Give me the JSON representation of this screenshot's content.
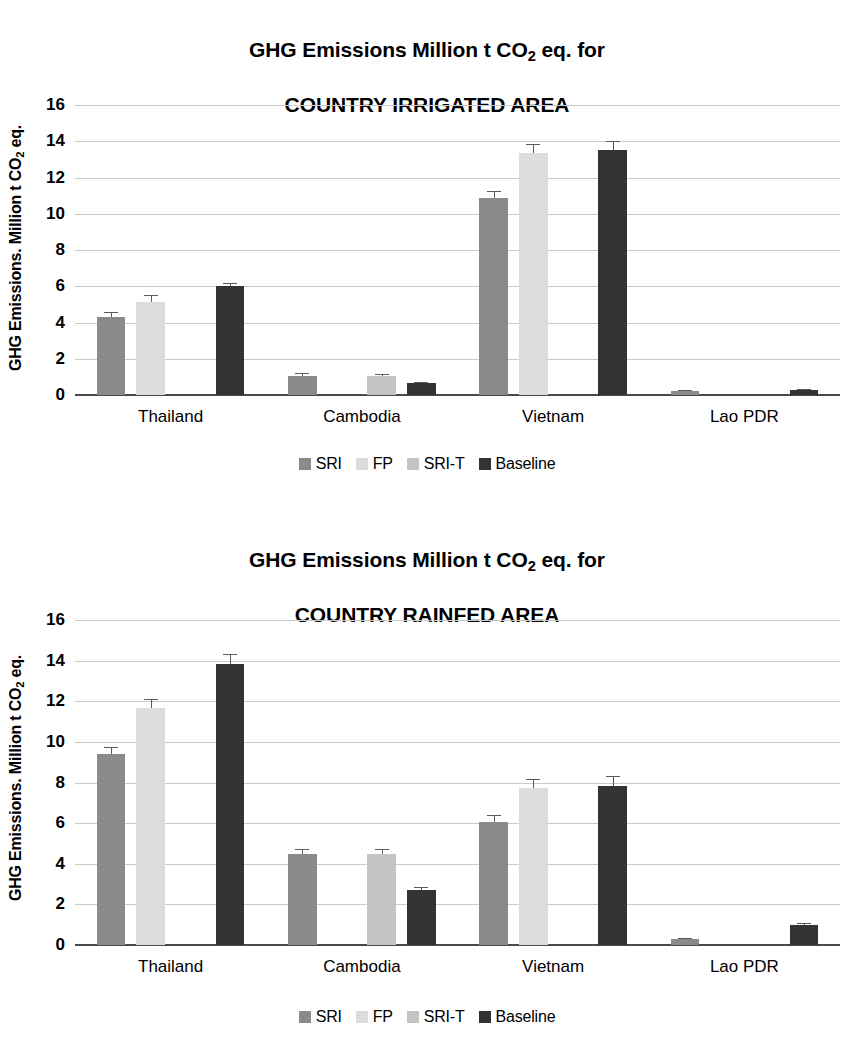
{
  "chart_data": [
    {
      "type": "bar",
      "id": "irrigated",
      "title": "GHG Emissions Million t CO2 eq. for COUNTRY IRRIGATED AREA",
      "title_lines": [
        "GHG Emissions Million t CO",
        "2",
        " eq. for",
        "COUNTRY IRRIGATED AREA"
      ],
      "title_line1_pre": "GHG Emissions Million t CO",
      "title_line1_sub": "2",
      "title_line1_post": " eq. for",
      "title_line2": "COUNTRY IRRIGATED AREA",
      "xlabel": "",
      "ylabel_pre": "GHG Emissions. Million t CO",
      "ylabel_sub": "2",
      "ylabel_post": " eq.",
      "ylim": [
        0,
        16
      ],
      "yticks": [
        0,
        2,
        4,
        6,
        8,
        10,
        12,
        14,
        16
      ],
      "ytick_labels": [
        "0",
        "2",
        "4",
        "6",
        "8",
        "10",
        "12",
        "14",
        "16"
      ],
      "grid": true,
      "legend_position": "bottom",
      "categories": [
        "Thailand",
        "Cambodia",
        "Vietnam",
        "Lao PDR"
      ],
      "series": [
        {
          "name": "SRI",
          "color": "#8a8a8a",
          "values": [
            4.3,
            1.05,
            10.85,
            0.2
          ],
          "errors": [
            0.3,
            0.15,
            0.4,
            0.05
          ]
        },
        {
          "name": "FP",
          "color": "#dcdcdc",
          "values": [
            5.15,
            null,
            13.35,
            null
          ],
          "errors": [
            0.35,
            null,
            0.5,
            null
          ]
        },
        {
          "name": "SRI-T",
          "color": "#c4c4c4",
          "values": [
            null,
            1.05,
            null,
            null
          ],
          "errors": [
            null,
            0.12,
            null,
            null
          ]
        },
        {
          "name": "Baseline",
          "color": "#333333",
          "values": [
            6.0,
            0.65,
            13.5,
            0.3
          ],
          "errors": [
            0.2,
            0.08,
            0.5,
            0.05
          ]
        }
      ]
    },
    {
      "type": "bar",
      "id": "rainfed",
      "title": "GHG Emissions Million t CO2 eq. for COUNTRY RAINFED AREA",
      "title_line1_pre": "GHG Emissions Million t CO",
      "title_line1_sub": "2",
      "title_line1_post": " eq. for",
      "title_line2": "COUNTRY RAINFED AREA",
      "xlabel": "",
      "ylabel_pre": "GHG Emissions. Million t CO",
      "ylabel_sub": "2",
      "ylabel_post": " eq.",
      "ylim": [
        0,
        16
      ],
      "yticks": [
        0,
        2,
        4,
        6,
        8,
        10,
        12,
        14,
        16
      ],
      "ytick_labels": [
        "0",
        "2",
        "4",
        "6",
        "8",
        "10",
        "12",
        "14",
        "16"
      ],
      "grid": true,
      "legend_position": "bottom",
      "categories": [
        "Thailand",
        "Cambodia",
        "Vietnam",
        "Lao PDR"
      ],
      "series": [
        {
          "name": "SRI",
          "color": "#8a8a8a",
          "values": [
            9.4,
            4.5,
            6.05,
            0.3
          ],
          "errors": [
            0.35,
            0.25,
            0.35,
            0.05
          ]
        },
        {
          "name": "FP",
          "color": "#dcdcdc",
          "values": [
            11.65,
            null,
            7.75,
            null
          ],
          "errors": [
            0.45,
            null,
            0.4,
            null
          ]
        },
        {
          "name": "SRI-T",
          "color": "#c4c4c4",
          "values": [
            null,
            4.5,
            null,
            null
          ],
          "errors": [
            null,
            0.25,
            null,
            null
          ]
        },
        {
          "name": "Baseline",
          "color": "#333333",
          "values": [
            13.85,
            2.7,
            7.85,
            1.0
          ],
          "errors": [
            0.5,
            0.15,
            0.45,
            0.07
          ]
        }
      ]
    }
  ],
  "legend": {
    "items": [
      {
        "label": "SRI",
        "color": "#8a8a8a"
      },
      {
        "label": "FP",
        "color": "#dcdcdc"
      },
      {
        "label": "SRI-T",
        "color": "#c4c4c4"
      },
      {
        "label": "Baseline",
        "color": "#333333"
      }
    ]
  },
  "colors": {
    "sri": "#8a8a8a",
    "fp": "#dcdcdc",
    "sri_t": "#c4c4c4",
    "baseline": "#333333",
    "gridline": "#c9c9c9",
    "axis": "#4a4a4a",
    "text": "#000000",
    "background": "#ffffff"
  }
}
